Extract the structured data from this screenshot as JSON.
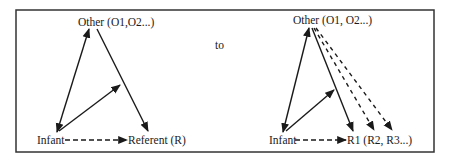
{
  "diagram": {
    "connector_label": "to",
    "left": {
      "other_label": "Other (O1,O2...)",
      "infant_label": "Infant",
      "referent_label": "Referent (R)"
    },
    "right": {
      "other_label": "Other (O1, O2...)",
      "infant_label": "Infant",
      "referent_label": "R1 (R2, R3...)"
    },
    "colors": {
      "line": "#1a1a1a",
      "frame": "#333333",
      "background": "#ffffff"
    }
  }
}
